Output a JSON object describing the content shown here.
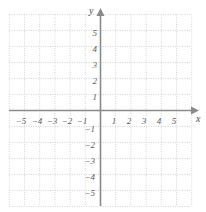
{
  "chart_data": {
    "type": "scatter",
    "title": "",
    "subtitle": "",
    "xlabel": "x",
    "ylabel": "y",
    "xlim": [
      -6,
      6
    ],
    "ylim": [
      -6,
      6
    ],
    "grid": true,
    "grid_style": "dotted",
    "legend": null,
    "series": [],
    "x_ticks": [
      -5,
      -4,
      -3,
      -2,
      -1,
      1,
      2,
      3,
      4,
      5
    ],
    "y_ticks": [
      5,
      4,
      3,
      2,
      1,
      -1,
      -2,
      -3,
      -4,
      -5
    ],
    "x_tick_labels": [
      "−5",
      "−4",
      "−3",
      "−2",
      "−1",
      "1",
      "2",
      "3",
      "4",
      "5"
    ],
    "y_tick_labels": [
      "5",
      "4",
      "3",
      "2",
      "1",
      "−1",
      "−2",
      "−3",
      "−4",
      "−5"
    ],
    "annotations": [],
    "colors": {
      "grid": "#c9c9c9",
      "axis": "#8a8a8a",
      "label": "#5a5a5a",
      "background": "#ffffff"
    }
  },
  "axes": {
    "x_axis_label": "x",
    "y_axis_label": "y"
  },
  "icons": {
    "x_arrow": "arrow-right-icon",
    "y_arrow": "arrow-up-icon"
  }
}
